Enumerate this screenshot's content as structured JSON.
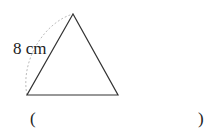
{
  "figure": {
    "shape": "equilateral-triangle",
    "side_label": "8 cm",
    "vertices": {
      "apex": [
        73,
        14
      ],
      "bottom_left": [
        27,
        95
      ],
      "bottom_right": [
        118,
        95
      ]
    },
    "stroke_color": "#333333",
    "arc_color": "#bbbbbb"
  },
  "answer": {
    "open_paren": "(",
    "close_paren": ")",
    "blank": ""
  }
}
